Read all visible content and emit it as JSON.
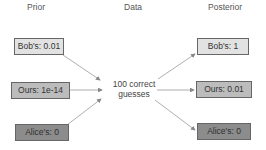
{
  "columns": {
    "prior": "Prior",
    "data": "Data",
    "posterior": "Posterior"
  },
  "prior": [
    {
      "label": "Bob's: 0.01",
      "shade": "light"
    },
    {
      "label": "Ours: 1e-14",
      "shade": "mid"
    },
    {
      "label": "Alice's: 0",
      "shade": "dark"
    }
  ],
  "data": {
    "line1": "100 correct",
    "line2": "guesses"
  },
  "posterior": [
    {
      "label": "Bob's: 1",
      "shade": "light"
    },
    {
      "label": "Ours: 0.01",
      "shade": "mid"
    },
    {
      "label": "Alice's: 0",
      "shade": "dark"
    }
  ],
  "colors": {
    "light": "#e2e2e2",
    "mid": "#bcbcbc",
    "dark": "#8c8c8c",
    "arrow": "#999999"
  }
}
